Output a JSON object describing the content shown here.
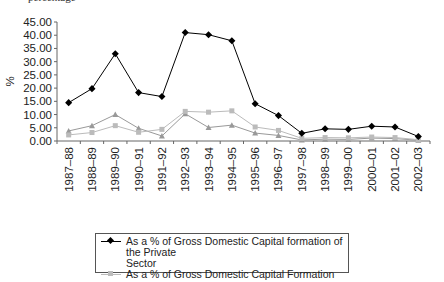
{
  "header": {
    "partial_text": "percentage"
  },
  "chart_data": {
    "type": "line",
    "title": "",
    "xlabel": "",
    "ylabel": "%",
    "ylim": [
      0,
      45
    ],
    "yticks": [
      "0.00",
      "5.00",
      "10.00",
      "15.00",
      "20.00",
      "25.00",
      "30.00",
      "35.00",
      "40.00",
      "45.00"
    ],
    "grid": false,
    "legend_position": "bottom",
    "categories": [
      "1987–88",
      "1988–89",
      "1989–90",
      "1990–91",
      "1991–92",
      "1992–93",
      "1993–94",
      "1994–95",
      "1995–96",
      "1996–97",
      "1997–98",
      "1998–99",
      "1999–00",
      "2000–01",
      "2001–02",
      "2002–03"
    ],
    "series": [
      {
        "name": "As a % of Gross Domestic Capital formation of the Private Sector",
        "marker": "diamond",
        "color": "#000000",
        "values": [
          14.5,
          19.8,
          33.0,
          18.3,
          16.8,
          41.0,
          40.2,
          37.9,
          14.1,
          9.6,
          2.9,
          4.6,
          4.4,
          5.6,
          5.3,
          1.7
        ]
      },
      {
        "name": "As a % of Gross Domestic Capital Formation",
        "marker": "square",
        "color": "#bbbbbb",
        "values": [
          2.3,
          3.2,
          5.8,
          3.3,
          4.4,
          11.2,
          10.9,
          11.4,
          5.3,
          4.0,
          1.0,
          1.3,
          1.2,
          1.5,
          1.3,
          0.5
        ]
      },
      {
        "name": "",
        "marker": "triangle",
        "color": "#999999",
        "values": [
          3.8,
          5.8,
          10.0,
          4.8,
          1.9,
          10.3,
          5.1,
          6.0,
          3.0,
          2.1,
          0.4,
          0.7,
          0.6,
          1.1,
          0.9,
          0.3
        ]
      }
    ]
  },
  "legend": {
    "items": [
      {
        "label_line1": "As a % of Gross Domestic Capital formation of the Private",
        "label_line2": "Sector"
      },
      {
        "label_line1": "As a % of Gross Domestic Capital Formation",
        "label_line2": ""
      }
    ]
  }
}
